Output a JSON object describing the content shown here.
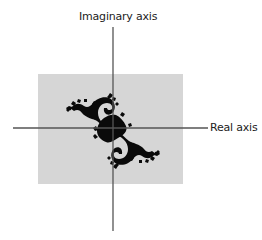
{
  "diagram": {
    "type": "complex-plane-julia-set",
    "y_axis_label": "Imaginary axis",
    "x_axis_label": "Real axis",
    "colors": {
      "background": "#ffffff",
      "region_fill": "#d6d6d6",
      "axis": "#555555",
      "fractal": "#0a0a0a"
    },
    "region": {
      "x": 38,
      "y": 74,
      "width": 145,
      "height": 110
    },
    "origin": {
      "x": 113,
      "y": 128
    }
  }
}
